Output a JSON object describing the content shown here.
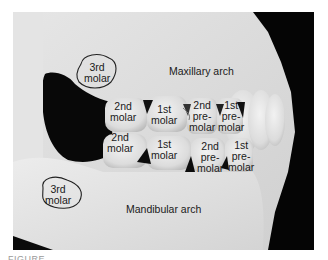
{
  "figure": {
    "arches": {
      "maxillary": "Maxillary arch",
      "mandibular": "Mandibular arch"
    },
    "maxillary_teeth": [
      {
        "line1": "3rd",
        "line2": "molar",
        "outlined": true
      },
      {
        "line1": "2nd",
        "line2": "molar"
      },
      {
        "line1": "1st",
        "line2": "molar"
      },
      {
        "line1": "2nd",
        "line2": "pre-",
        "line3": "molar"
      },
      {
        "line1": "1st",
        "line2": "pre-",
        "line3": "molar"
      }
    ],
    "mandibular_teeth": [
      {
        "line1": "3rd",
        "line2": "molar",
        "outlined": true
      },
      {
        "line1": "2nd",
        "line2": "molar"
      },
      {
        "line1": "1st",
        "line2": "molar"
      },
      {
        "line1": "2nd",
        "line2": "pre-",
        "line3": "molar"
      },
      {
        "line1": "1st",
        "line2": "pre-",
        "line3": "molar"
      }
    ],
    "caption_partial": "FIGURE"
  },
  "colors": {
    "bone": "#dedede",
    "shadow": "#0a0a0a",
    "text": "#1a1a1a",
    "outline": "#222222"
  }
}
